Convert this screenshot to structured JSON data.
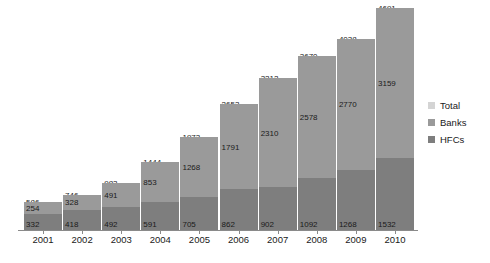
{
  "chart_data": {
    "type": "bar",
    "stacked": true,
    "title": "",
    "subtitle": "",
    "xlabel": "",
    "ylabel": "",
    "grid": false,
    "legend_position": "right",
    "ylim": [
      0,
      4691
    ],
    "categories": [
      "2001",
      "2002",
      "2003",
      "2004",
      "2005",
      "2006",
      "2007",
      "2008",
      "2009",
      "2010"
    ],
    "series": [
      {
        "name": "HFCs",
        "color": "#7e7e7e",
        "values": [
          332,
          418,
          492,
          591,
          705,
          862,
          902,
          1092,
          1268,
          1532
        ]
      },
      {
        "name": "Banks",
        "color": "#9a9a9a",
        "values": [
          254,
          328,
          491,
          853,
          1268,
          1791,
          2310,
          2578,
          2770,
          3159
        ]
      },
      {
        "name": "Total",
        "color": "#d4d4d4",
        "values": [
          586,
          746,
          983,
          1444,
          1973,
          2653,
          3212,
          3670,
          4038,
          4691
        ]
      }
    ],
    "bars": [
      {
        "year": "2001",
        "hfcs": 332,
        "banks": 254,
        "total": 586
      },
      {
        "year": "2002",
        "hfcs": 418,
        "banks": 328,
        "total": 746
      },
      {
        "year": "2003",
        "hfcs": 492,
        "banks": 491,
        "total": 983
      },
      {
        "year": "2004",
        "hfcs": 591,
        "banks": 853,
        "total": 1444
      },
      {
        "year": "2005",
        "hfcs": 705,
        "banks": 1268,
        "total": 1973
      },
      {
        "year": "2006",
        "hfcs": 862,
        "banks": 1791,
        "total": 2653
      },
      {
        "year": "2007",
        "hfcs": 902,
        "banks": 2310,
        "total": 3212
      },
      {
        "year": "2008",
        "hfcs": 1092,
        "banks": 2578,
        "total": 3670
      },
      {
        "year": "2009",
        "hfcs": 1268,
        "banks": 2770,
        "total": 4038
      },
      {
        "year": "2010",
        "hfcs": 1532,
        "banks": 3159,
        "total": 4691
      }
    ]
  },
  "legend": {
    "items": [
      {
        "label": "Total",
        "color": "#d4d4d4"
      },
      {
        "label": "Banks",
        "color": "#9a9a9a"
      },
      {
        "label": "HFCs",
        "color": "#7e7e7e"
      }
    ]
  },
  "colors": {
    "total": "#d4d4d4",
    "banks": "#9a9a9a",
    "hfcs": "#7e7e7e",
    "axis": "#8a8a8a",
    "text": "#1a1a1a",
    "background": "#ffffff"
  }
}
